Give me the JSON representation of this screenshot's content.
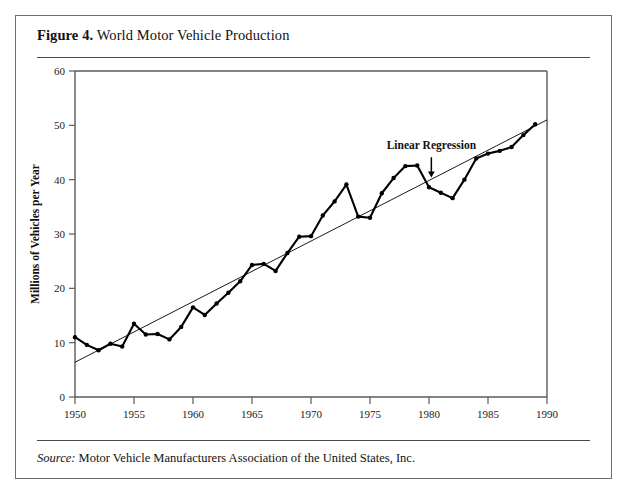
{
  "figure": {
    "label": "Figure 4.",
    "title": " World Motor Vehicle Production",
    "source_label": "Source:",
    "source_text": " Motor Vehicle Manufacturers Association of the United States, Inc."
  },
  "chart_data": {
    "type": "line",
    "title": "World Motor Vehicle Production",
    "xlabel": "",
    "ylabel": "Millions of Vehicles per Year",
    "xlim": [
      1950,
      1990
    ],
    "ylim": [
      0,
      60
    ],
    "xticks": [
      1950,
      1955,
      1960,
      1965,
      1970,
      1975,
      1980,
      1985,
      1990
    ],
    "yticks": [
      0,
      10,
      20,
      30,
      40,
      50,
      60
    ],
    "grid": false,
    "legend": "none",
    "series": [
      {
        "name": "World Motor Vehicle Production",
        "style": "line-with-markers",
        "color": "#000000",
        "x": [
          1950,
          1951,
          1952,
          1953,
          1954,
          1955,
          1956,
          1957,
          1958,
          1959,
          1960,
          1961,
          1962,
          1963,
          1964,
          1965,
          1966,
          1967,
          1968,
          1969,
          1970,
          1971,
          1972,
          1973,
          1974,
          1975,
          1976,
          1977,
          1978,
          1979,
          1980,
          1981,
          1982,
          1983,
          1984,
          1985,
          1986,
          1987,
          1988,
          1989
        ],
        "values": [
          11.0,
          9.6,
          8.6,
          9.8,
          9.3,
          13.5,
          11.5,
          11.6,
          10.6,
          12.9,
          16.5,
          15.1,
          17.2,
          19.2,
          21.3,
          24.3,
          24.5,
          23.2,
          26.5,
          29.5,
          29.6,
          33.4,
          36.0,
          39.1,
          33.2,
          33.0,
          37.5,
          40.3,
          42.5,
          42.6,
          38.6,
          37.6,
          36.6,
          40.0,
          43.9,
          44.8,
          45.3,
          46.0,
          48.2,
          50.2
        ]
      },
      {
        "name": "Linear Regression",
        "style": "straight-line",
        "color": "#000000",
        "x": [
          1950,
          1990
        ],
        "values": [
          6.4,
          51.0
        ]
      }
    ],
    "annotations": [
      {
        "text": "Linear Regression",
        "x": 1980.2,
        "y": 45.6,
        "arrow_to_x": 1980.2,
        "arrow_to_y": 40.4
      }
    ]
  }
}
